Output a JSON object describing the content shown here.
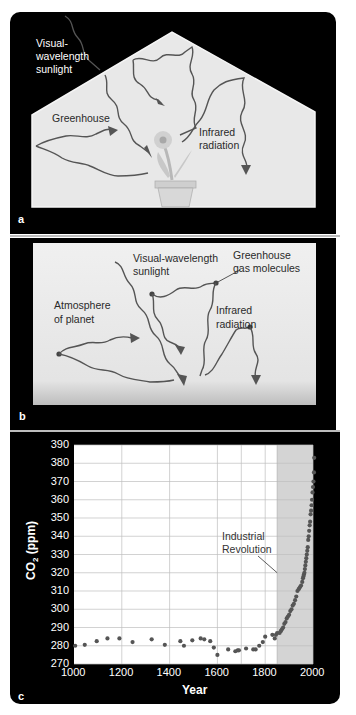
{
  "panels": {
    "a": {
      "label": "a",
      "sunlight_label_line1": "Visual-",
      "sunlight_label_line2": "wavelength",
      "sunlight_label_line3": "sunlight",
      "greenhouse_label": "Greenhouse",
      "infrared_label_line1": "Infrared",
      "infrared_label_line2": "radiation"
    },
    "b": {
      "label": "b",
      "sunlight_label_line1": "Visual-wavelength",
      "sunlight_label_line2": "sunlight",
      "gas_label_line1": "Greenhouse",
      "gas_label_line2": "gas molecules",
      "atmosphere_label_line1": "Atmosphere",
      "atmosphere_label_line2": "of planet",
      "infrared_label_line1": "Infrared",
      "infrared_label_line2": "radiation"
    },
    "c": {
      "label": "c",
      "annotation_line1": "Industrial",
      "annotation_line2": "Revolution"
    }
  },
  "colors": {
    "background": "#000000",
    "panel_fill": "#e6e6e6",
    "plot_bg": "#ffffff",
    "shade": "#d4d4d4",
    "grid": "#bfbfbf",
    "points": "#555555",
    "arrows": "#555555"
  },
  "chart_data": {
    "type": "scatter",
    "title": "",
    "xlabel": "Year",
    "ylabel": "CO2 (ppm)",
    "xlim": [
      1000,
      2000
    ],
    "ylim": [
      270,
      390
    ],
    "xticks": [
      1000,
      1200,
      1400,
      1600,
      1800,
      2000
    ],
    "yticks": [
      270,
      280,
      290,
      300,
      310,
      320,
      330,
      340,
      350,
      360,
      370,
      380,
      390
    ],
    "grid": true,
    "vertical_gridlines": [
      1200,
      1400,
      1600,
      1700,
      1800,
      2000
    ],
    "shaded_region": {
      "from": 1850,
      "to": 2000,
      "label": "Industrial Revolution"
    },
    "annotation": {
      "text": "Industrial Revolution",
      "points_to": [
        1850,
        320
      ]
    },
    "series": [
      {
        "name": "CO2 concentration",
        "x": [
          1005,
          1045,
          1095,
          1140,
          1190,
          1245,
          1325,
          1380,
          1445,
          1460,
          1495,
          1530,
          1545,
          1570,
          1585,
          1600,
          1645,
          1675,
          1685,
          1690,
          1720,
          1750,
          1760,
          1775,
          1790,
          1800,
          1830,
          1840,
          1845,
          1850,
          1860,
          1865,
          1870,
          1875,
          1880,
          1885,
          1890,
          1895,
          1900,
          1905,
          1910,
          1915,
          1920,
          1925,
          1930,
          1935,
          1940,
          1945,
          1950,
          1955,
          1958,
          1960,
          1962,
          1964,
          1966,
          1968,
          1970,
          1972,
          1974,
          1976,
          1978,
          1980,
          1982,
          1984,
          1986,
          1988,
          1990,
          1992,
          1994,
          1996,
          1998,
          2000,
          2002,
          2004,
          2005
        ],
        "y": [
          280,
          280.5,
          282.5,
          284,
          284,
          282,
          283.5,
          280.5,
          282.5,
          280,
          283,
          284,
          283.5,
          282.5,
          279,
          275,
          278,
          277,
          277.5,
          277.5,
          278.5,
          278,
          278,
          280,
          282,
          285,
          286,
          284,
          286,
          287,
          287,
          288,
          289,
          290,
          292,
          293,
          295,
          296,
          297,
          299,
          300,
          302,
          303,
          305,
          307,
          310,
          311,
          312,
          313,
          315,
          317,
          318,
          319,
          320,
          322,
          324,
          326,
          328,
          330,
          332,
          334,
          338,
          340,
          343,
          346,
          348,
          352,
          354,
          357,
          360,
          364,
          367,
          370,
          375,
          383
        ]
      }
    ]
  }
}
